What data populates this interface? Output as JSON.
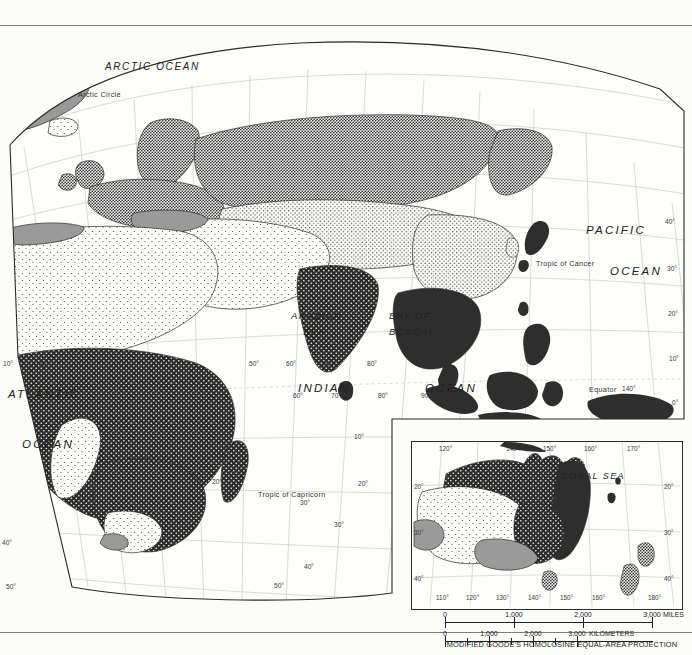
{
  "page": {
    "kind": "thematic-world-map",
    "hemisphere": "Eastern Hemisphere",
    "projection_note": "MODIFIED GOODE'S HOMOLOSINE EQUAL-AREA PROJECTION"
  },
  "ocean_labels": {
    "arctic": "ARCTIC OCEAN",
    "atlantic_1": "ATLANTIC",
    "atlantic_2": "OCEAN",
    "indian_1": "INDIAN",
    "indian_2": "OCEAN",
    "pacific_1": "PACIFIC",
    "pacific_2": "OCEAN"
  },
  "sea_labels": {
    "arabian_1": "ARABIAN",
    "arabian_2": "SEA",
    "bengal_1": "BAY OF",
    "bengal_2": "BENGAL",
    "coral": "CORAL  SEA"
  },
  "reference_lines": {
    "arctic_circle": "Arctic Circle",
    "tropic_cancer": "Tropic of Cancer",
    "equator": "Equator",
    "tropic_capricorn": "Tropic of Capricorn"
  },
  "graticule": {
    "left_latitudes": [
      "40°",
      "50°"
    ],
    "right_latitudes": [
      "40°",
      "30°",
      "20°",
      "10°",
      "0°"
    ],
    "south_right_latitudes": [
      "20°",
      "30°",
      "40°",
      "50°"
    ],
    "equator_longitudes": [
      "10°",
      "0°",
      "50°",
      "60°",
      "70°",
      "80°",
      "90°",
      "140°"
    ],
    "indian_longitudes": [
      "60°",
      "70°",
      "80°",
      "90°"
    ],
    "south_longitudes": [
      "20°",
      "30°"
    ]
  },
  "inset": {
    "region": "Australia and New Zealand",
    "sea_label": "CORAL  SEA",
    "top_longitudes": [
      "120°",
      "140°",
      "150°",
      "160°",
      "170°"
    ],
    "bottom_longitudes": [
      "110°",
      "120°",
      "130°",
      "140°",
      "150°",
      "160°",
      "180°"
    ],
    "left_latitudes": [
      "20°",
      "30°",
      "40°"
    ],
    "right_latitudes": [
      "20°",
      "30°",
      "40°"
    ]
  },
  "scale": {
    "miles": {
      "unit": "MILES",
      "labels": [
        "0",
        "1,000",
        "2,000",
        "3,000"
      ]
    },
    "kilometers": {
      "unit": "KILOMETERS",
      "labels": [
        "0",
        "1,000",
        "2,000",
        "3,000"
      ]
    },
    "projection": "MODIFIED GOODE'S HOMOLOSINE EQUAL-AREA PROJECTION"
  },
  "colors": {
    "paper": "#fcfcfa",
    "ink": "#1a1a1a",
    "rule": "#7d7d7d",
    "graticule": "#b9b9b9",
    "coast": "#2b2b2b",
    "fill_solid_dark": "#2e2e2e",
    "fill_gray": "#9a9a9a",
    "fill_light": "#fdfdfb"
  }
}
